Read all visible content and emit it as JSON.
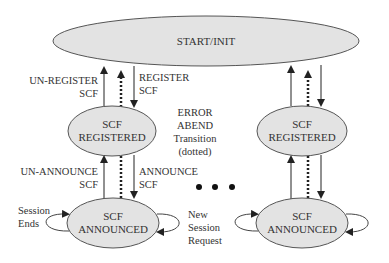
{
  "nodes": {
    "start": {
      "label": "START/INIT"
    },
    "registered_left": {
      "line1": "SCF",
      "line2": "REGISTERED"
    },
    "announced_left": {
      "line1": "SCF",
      "line2": "ANNOUNCED"
    },
    "registered_right": {
      "line1": "SCF",
      "line2": "REGISTERED"
    },
    "announced_right": {
      "line1": "SCF",
      "line2": "ANNOUNCED"
    }
  },
  "edges": {
    "unregister": {
      "line1": "UN-REGISTER",
      "line2": "SCF"
    },
    "register": {
      "line1": "REGISTER",
      "line2": "SCF"
    },
    "unannounce": {
      "line1": "UN-ANNOUNCE",
      "line2": "SCF"
    },
    "announce": {
      "line1": "ANNOUNCE",
      "line2": "SCF"
    },
    "session_ends": {
      "line1": "Session",
      "line2": "Ends"
    },
    "new_session": {
      "line1": "New",
      "line2": "Session",
      "line3": "Request"
    }
  },
  "legend": {
    "line1": "ERROR",
    "line2": "ABEND",
    "line3": "Transition",
    "line4": "(dotted)"
  },
  "ellipsis": "• • •",
  "colors": {
    "node_fill": "#e3e3e3",
    "node_stroke": "#555555",
    "arrow": "#222222",
    "text": "#333333"
  }
}
